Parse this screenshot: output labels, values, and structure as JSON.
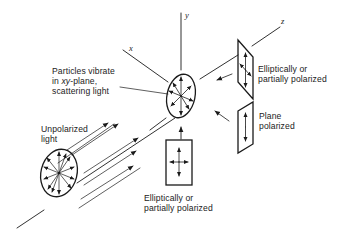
{
  "figure": {
    "axes": {
      "x": "x",
      "y": "y",
      "z": "z"
    },
    "labels": {
      "particles": {
        "line1": "Particles vibrate",
        "line2_prefix": "in ",
        "line2_italic": "xy",
        "line2_suffix": "-plane,",
        "line3": "scattering light"
      },
      "unpolarized": {
        "line1": "Unpolarized",
        "line2": "light"
      },
      "right_top": {
        "line1": "Elliptically or",
        "line2": "partially polarized"
      },
      "right_mid": {
        "line1": "Plane",
        "line2": "polarized"
      },
      "bottom": {
        "line1": "Elliptically or",
        "line2": "partially polarized"
      }
    },
    "colors": {
      "stroke": "#1a1a1a",
      "background": "#ffffff"
    }
  }
}
